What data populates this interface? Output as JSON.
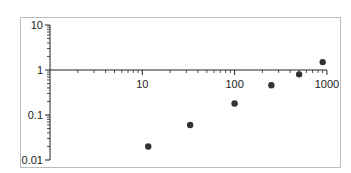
{
  "chart_data": {
    "type": "scatter",
    "title": "",
    "xlabel": "",
    "ylabel": "",
    "xscale": "log",
    "yscale": "log",
    "xlim": [
      1,
      1000
    ],
    "ylim": [
      0.01,
      10
    ],
    "x_ticks": [
      "10",
      "100",
      "1000"
    ],
    "y_ticks": [
      "10",
      "1",
      "0.1",
      "0.01"
    ],
    "grid": false,
    "legend": null,
    "marker_color": "#333333",
    "series": [
      {
        "name": "data",
        "x": [
          11.6,
          33,
          100,
          250,
          500,
          900
        ],
        "y": [
          0.02,
          0.06,
          0.18,
          0.46,
          0.8,
          1.5
        ]
      }
    ]
  }
}
